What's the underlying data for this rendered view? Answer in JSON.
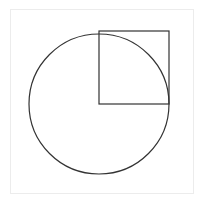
{
  "diagram": {
    "colors": {
      "stroke": "#333333",
      "frame": "#ececec",
      "background": "#ffffff"
    },
    "circle": {
      "cx": 99,
      "cy": 104,
      "r": 70
    },
    "square": {
      "x": 99,
      "y": 31,
      "width": 70,
      "height": 73
    }
  }
}
